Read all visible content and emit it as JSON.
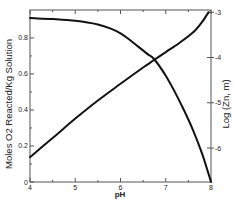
{
  "chart_data": {
    "type": "line",
    "title": "",
    "xlabel": "pH",
    "ylabel": "Moles O2 Reacted/Kg Solution",
    "ylabel_right": "Log (Zn, m)",
    "xlim": [
      4,
      8
    ],
    "ylim": [
      0,
      0.955
    ],
    "ylim_right": [
      -6.75,
      -2.95
    ],
    "x_ticks": [
      4,
      5,
      6,
      7,
      8
    ],
    "x_minor_ticks": [
      4.5,
      5.5,
      6.5,
      7.5
    ],
    "y_ticks": [
      0,
      0.2,
      0.4,
      0.6,
      0.8
    ],
    "y_tick_labels": [
      "0",
      "0.2",
      "0.4",
      "0.6",
      "0.8"
    ],
    "y_minor_ticks": [
      0.1,
      0.3,
      0.5,
      0.7
    ],
    "y_right_ticks": [
      -3,
      -4,
      -5,
      -6
    ],
    "y_right_tick_labels": [
      "-3",
      "-4",
      "-5",
      "-6"
    ],
    "grid": false,
    "legend": "none",
    "series": [
      {
        "name": "Moles O2 Reacted/Kg Solution",
        "axis": "left",
        "x": [
          4.0,
          4.5,
          5.0,
          5.5,
          5.8,
          6.0,
          6.2,
          6.4,
          6.6,
          6.75,
          7.0,
          7.2,
          7.4,
          7.6,
          7.8,
          8.0
        ],
        "y": [
          0.91,
          0.905,
          0.895,
          0.875,
          0.85,
          0.825,
          0.79,
          0.75,
          0.71,
          0.68,
          0.59,
          0.5,
          0.4,
          0.29,
          0.16,
          0.0
        ]
      },
      {
        "name": "Log (Zn, m)",
        "axis": "right",
        "x": [
          4.0,
          4.5,
          5.0,
          5.5,
          6.0,
          6.5,
          6.75,
          7.0,
          7.3,
          7.6,
          7.8,
          7.9,
          7.95
        ],
        "y": [
          -6.2,
          -5.78,
          -5.35,
          -4.95,
          -4.58,
          -4.22,
          -4.05,
          -3.88,
          -3.68,
          -3.45,
          -3.22,
          -3.07,
          -3.0
        ]
      }
    ]
  }
}
